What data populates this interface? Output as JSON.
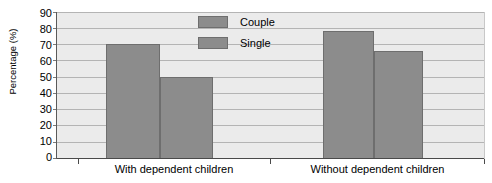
{
  "chart_data": {
    "type": "bar",
    "title": "",
    "xlabel": "",
    "ylabel": "Percentage (%)",
    "ylim": [
      0,
      90
    ],
    "ytick_step": 10,
    "yticks": [
      90,
      80,
      70,
      60,
      50,
      40,
      30,
      20,
      10,
      0
    ],
    "grid": true,
    "legend_position": "top-center",
    "categories": [
      "With dependent children",
      "Without dependent children"
    ],
    "series": [
      {
        "name": "Couple",
        "values": [
          70,
          78
        ]
      },
      {
        "name": "Single",
        "values": [
          50,
          66
        ]
      }
    ],
    "colors": {
      "bar_fill": "#8c8c8c",
      "bar_outline": "#6e6e6e",
      "plot_background": "#ebebeb",
      "gridline": "#b4b4b4",
      "axis": "#4a4a4a",
      "page_background": "#ffffff"
    }
  },
  "legend": {
    "items": [
      {
        "label": "Couple"
      },
      {
        "label": "Single"
      }
    ]
  },
  "axis": {
    "y_title": "Percentage (%)",
    "y_ticks": [
      "90",
      "80",
      "70",
      "60",
      "50",
      "40",
      "30",
      "20",
      "10",
      "0"
    ],
    "x_categories": [
      "With dependent children",
      "Without dependent children"
    ]
  }
}
